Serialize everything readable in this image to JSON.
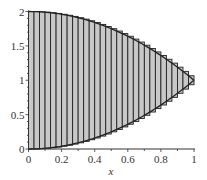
{
  "chart_data": {
    "type": "area",
    "title": "",
    "xlabel": "x",
    "ylabel": "",
    "xlim": [
      0,
      1
    ],
    "ylim": [
      0,
      2
    ],
    "grid": false,
    "legend": null,
    "x_ticks": [
      "0",
      "0.2",
      "0.4",
      "0.6",
      "0.8",
      "1"
    ],
    "y_ticks": [
      "0",
      "0.5",
      "1",
      "1.5",
      "2"
    ],
    "series": [
      {
        "name": "upper curve",
        "expression": "2 - x^2",
        "x": [
          0,
          0.2,
          0.4,
          0.6,
          0.8,
          1
        ],
        "values": [
          2,
          1.96,
          1.84,
          1.64,
          1.36,
          1
        ]
      },
      {
        "name": "lower curve",
        "expression": "x^2",
        "x": [
          0,
          0.2,
          0.4,
          0.6,
          0.8,
          1
        ],
        "values": [
          0,
          0.04,
          0.16,
          0.36,
          0.64,
          1
        ]
      }
    ],
    "strips": {
      "count": 30,
      "fill": "#c8c8c8",
      "edge": "#222222"
    },
    "annotation": "Region between y = x^2 and y = 2 - x^2 on [0,1], shaded with vertical strips"
  }
}
